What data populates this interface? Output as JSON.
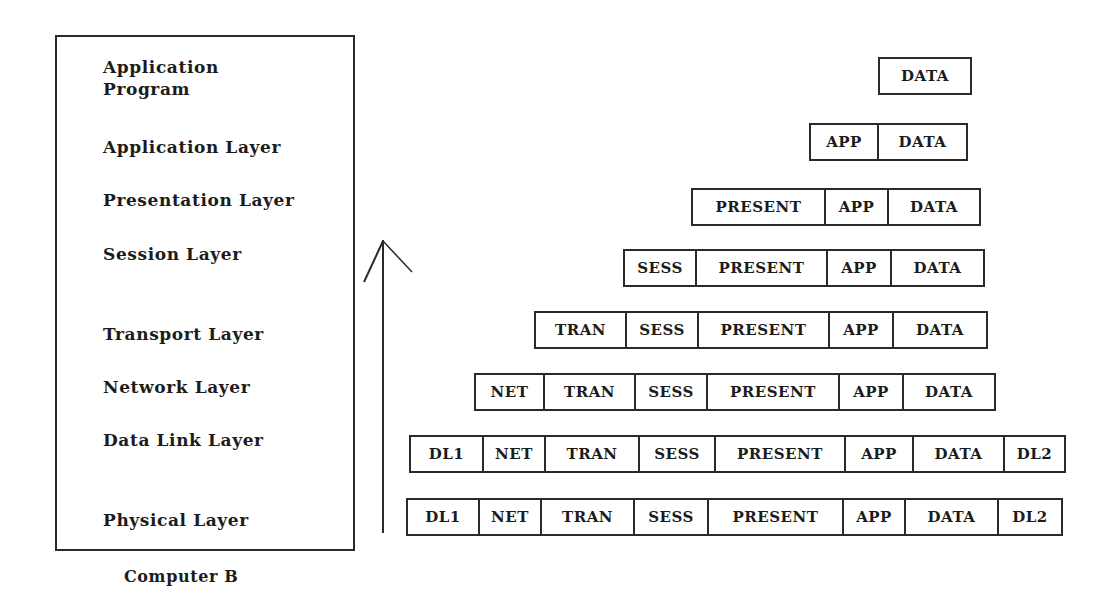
{
  "stack": {
    "title": "Computer B",
    "layers": [
      {
        "label": "Application\nProgram",
        "top": 56
      },
      {
        "label": "Application Layer",
        "top": 136
      },
      {
        "label": "Presentation Layer",
        "top": 189
      },
      {
        "label": "Session Layer",
        "top": 243
      },
      {
        "label": "Transport Layer",
        "top": 323
      },
      {
        "label": "Network Layer",
        "top": 376
      },
      {
        "label": "Data Link Layer",
        "top": 429
      },
      {
        "label": "Physical Layer",
        "top": 509
      }
    ]
  },
  "arrow": {
    "direction": "up",
    "icon": "up-arrow-icon"
  },
  "packets": [
    {
      "top": 57,
      "cells": [
        {
          "label": "DATA",
          "x": 878,
          "w": 92
        }
      ]
    },
    {
      "top": 123,
      "cells": [
        {
          "label": "APP",
          "x": 809,
          "w": 68
        },
        {
          "label": "DATA",
          "w": 89
        }
      ]
    },
    {
      "top": 188,
      "cells": [
        {
          "label": "PRESENT",
          "x": 691,
          "w": 133
        },
        {
          "label": "APP",
          "w": 63
        },
        {
          "label": "DATA",
          "w": 92
        }
      ]
    },
    {
      "top": 249,
      "cells": [
        {
          "label": "SESS",
          "x": 623,
          "w": 72
        },
        {
          "label": "PRESENT",
          "w": 131
        },
        {
          "label": "APP",
          "w": 64
        },
        {
          "label": "DATA",
          "w": 93
        }
      ]
    },
    {
      "top": 311,
      "cells": [
        {
          "label": "TRAN",
          "x": 534,
          "w": 91
        },
        {
          "label": "SESS",
          "w": 72
        },
        {
          "label": "PRESENT",
          "w": 131
        },
        {
          "label": "APP",
          "w": 64
        },
        {
          "label": "DATA",
          "w": 94
        }
      ]
    },
    {
      "top": 373,
      "cells": [
        {
          "label": "NET",
          "x": 474,
          "w": 69
        },
        {
          "label": "TRAN",
          "w": 91
        },
        {
          "label": "SESS",
          "w": 72
        },
        {
          "label": "PRESENT",
          "w": 132
        },
        {
          "label": "APP",
          "w": 64
        },
        {
          "label": "DATA",
          "w": 92
        }
      ]
    },
    {
      "top": 435,
      "cells": [
        {
          "label": "DL1",
          "x": 409,
          "w": 73
        },
        {
          "label": "NET",
          "w": 62
        },
        {
          "label": "TRAN",
          "w": 94
        },
        {
          "label": "SESS",
          "w": 76
        },
        {
          "label": "PRESENT",
          "w": 130
        },
        {
          "label": "APP",
          "w": 68
        },
        {
          "label": "DATA",
          "w": 91
        },
        {
          "label": "DL2",
          "w": 61
        }
      ]
    },
    {
      "top": 498,
      "cells": [
        {
          "label": "DL1",
          "x": 406,
          "w": 72
        },
        {
          "label": "NET",
          "w": 62
        },
        {
          "label": "TRAN",
          "w": 93
        },
        {
          "label": "SESS",
          "w": 74
        },
        {
          "label": "PRESENT",
          "w": 135
        },
        {
          "label": "APP",
          "w": 62
        },
        {
          "label": "DATA",
          "w": 93
        },
        {
          "label": "DL2",
          "w": 64
        }
      ]
    }
  ]
}
